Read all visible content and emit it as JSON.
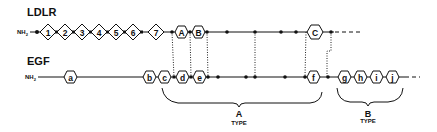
{
  "diagram": {
    "type": "domain-alignment",
    "proteins": [
      {
        "name": "LDLR",
        "terminus": "NH2",
        "cysteine_rich_repeats": [
          "1",
          "2",
          "3",
          "4",
          "5",
          "6",
          "7"
        ],
        "egf_like_repeats": [
          "A",
          "B",
          "C"
        ]
      },
      {
        "name": "EGF",
        "terminus": "NH2",
        "repeats": [
          "a",
          "b",
          "c",
          "d",
          "e",
          "f",
          "g",
          "h",
          "i",
          "j"
        ]
      }
    ],
    "groups": [
      {
        "letter": "A",
        "word": "TYPE",
        "covers": [
          "c",
          "d",
          "e",
          "f"
        ]
      },
      {
        "letter": "B",
        "word": "TYPE",
        "covers": [
          "g",
          "h",
          "i",
          "j"
        ]
      }
    ]
  },
  "labels": {
    "ldlr": "LDLR",
    "egf": "EGF",
    "nh": "NH",
    "nh_sub": "2",
    "type_a_letter": "A",
    "type_a_word": "TYPE",
    "type_b_letter": "B",
    "type_b_word": "TYPE"
  },
  "ldlr_diamonds": [
    "1",
    "2",
    "3",
    "4",
    "5",
    "6",
    "7"
  ],
  "ldlr_hexagons": [
    "A",
    "B",
    "C"
  ],
  "egf_hexagons": [
    "a",
    "b",
    "c",
    "d",
    "e",
    "f",
    "g",
    "h",
    "i",
    "j"
  ]
}
